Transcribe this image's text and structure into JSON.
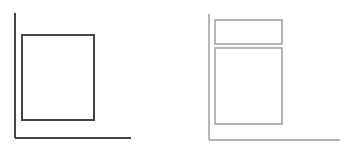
{
  "diagrams": [
    {
      "name": "single-box-layout",
      "stroke_color": "#444444",
      "axis": {
        "x": 15,
        "top": 13,
        "bottom_y": 138,
        "right": 131
      },
      "boxes": [
        {
          "left": 22,
          "top": 35,
          "right": 94,
          "bottom": 120
        }
      ]
    },
    {
      "name": "stacked-box-layout",
      "stroke_color": "#999999",
      "axis": {
        "x": 209,
        "top": 14,
        "bottom_y": 140,
        "right": 340
      },
      "boxes": [
        {
          "left": 215,
          "top": 20,
          "right": 282,
          "bottom": 44
        },
        {
          "left": 215,
          "top": 48,
          "right": 282,
          "bottom": 124
        }
      ]
    }
  ]
}
